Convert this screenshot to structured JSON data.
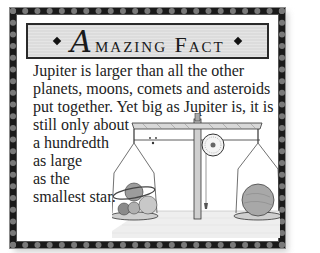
{
  "card": {
    "title_initial": "A",
    "title_rest": "mazing Fact",
    "title_full": "Amazing Fact",
    "ornament_left": "diamond-ornament",
    "ornament_right": "diamond-ornament",
    "text_lines": [
      "Jupiter is larger than all the other",
      "planets, moons, comets and asteroids",
      "put together. Yet big as Jupiter is, it is",
      "still only about",
      "a hundredth",
      "as large",
      "as the",
      "smallest star."
    ],
    "illustration": {
      "description": "balance scale with planets on left pan and a single sphere on right pan",
      "left_pan": "ringed planet with smaller planets",
      "right_pan": "single large sphere"
    }
  },
  "colors": {
    "frame": "#1a1a1a",
    "title_bg": "#dcdcdc",
    "text": "#222222",
    "background": "#ffffff"
  }
}
